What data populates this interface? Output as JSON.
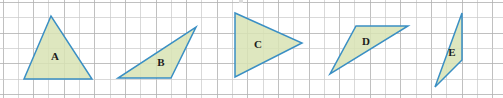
{
  "figure": {
    "width": 503,
    "height": 98,
    "background_color": "#ffffff"
  },
  "grid": {
    "cell_size": 15.3,
    "origin_x": 3.0,
    "origin_y": 2.5,
    "columns": 33,
    "rows": 7,
    "line_color": "#b0b0b0",
    "faint_line_color": "#c9c9c9",
    "visible": true
  },
  "style": {
    "triangle_fill": "#d8e3b4",
    "triangle_stroke": "#3a8fc4",
    "triangle_stroke_width": 1.5,
    "label_color": "#1c1c1c"
  },
  "shapes": [
    {
      "label": "A",
      "name": "triangle-a",
      "description": "Isosceles triangle with apex at top and horizontal base",
      "points": "51,16 24,79 92,79",
      "label_x": 55,
      "label_y": 57
    },
    {
      "label": "B",
      "name": "triangle-b",
      "description": "Obtuse scalene triangle with horizontal base and apex at upper right",
      "points": "118,78 171,78 196,27",
      "label_x": 161,
      "label_y": 63
    },
    {
      "label": "C",
      "name": "triangle-c",
      "description": "Triangle with vertical left side pointing right",
      "points": "235,13 235,77 302,43",
      "label_x": 258,
      "label_y": 45
    },
    {
      "label": "D",
      "name": "triangle-d",
      "description": "Triangle with horizontal top edge and vertex at lower left",
      "points": "356,26 408,26 330,74",
      "label_x": 366,
      "label_y": 42
    },
    {
      "label": "E",
      "name": "triangle-e",
      "description": "Tall narrow triangle with vertical right side",
      "points": "462,13 462,60 435,87",
      "label_x": 452,
      "label_y": 53
    }
  ]
}
